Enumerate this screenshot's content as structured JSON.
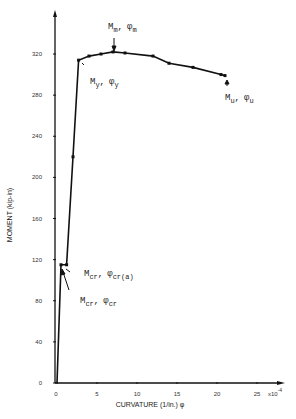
{
  "chart_data": {
    "type": "line",
    "title": "",
    "xlabel": "CURVATURE (1/in.) φ",
    "ylabel": "MOMENT (kip-in)",
    "x_multiplier_label": "x10",
    "x_multiplier_exp": "-4",
    "xlim": [
      0,
      28
    ],
    "ylim": [
      0,
      360
    ],
    "x_ticks": [
      0,
      5,
      10,
      15,
      20,
      25
    ],
    "y_ticks": [
      0,
      40,
      80,
      120,
      160,
      200,
      240,
      280,
      320
    ],
    "x_tick_labels": [
      "0",
      "5",
      "10",
      "15",
      "20",
      "25"
    ],
    "y_tick_labels": [
      "0",
      "40",
      "80",
      "120",
      "160",
      "200",
      "240",
      "280",
      "320"
    ],
    "grid": false,
    "series": [
      {
        "name": "Moment-Curvature",
        "x": [
          0.0,
          0.5,
          1.2,
          2.0,
          2.7,
          4.0,
          5.5,
          7.0,
          8.5,
          12.0,
          14.0,
          17.0,
          20.5,
          21.0
        ],
        "y": [
          0,
          115,
          115,
          220,
          314,
          318,
          320,
          322,
          321,
          318,
          311,
          307,
          300,
          299
        ]
      }
    ],
    "annotations": [
      {
        "label": "M",
        "sub1": "m",
        "phi_sub": "m",
        "text": "Mm, φm",
        "point": [
          7.0,
          322
        ]
      },
      {
        "label": "M",
        "sub1": "y",
        "phi_sub": "y",
        "text": "My, φy",
        "point": [
          2.7,
          314
        ]
      },
      {
        "label": "M",
        "sub1": "u",
        "phi_sub": "u",
        "text": "Mu, φu",
        "point": [
          21.0,
          299
        ]
      },
      {
        "label": "M",
        "sub1": "cr",
        "phi_sub": "cr(a)",
        "text": "Mcr, φcr(a)",
        "point": [
          1.2,
          115
        ]
      },
      {
        "label": "M",
        "sub1": "cr",
        "phi_sub": "cr",
        "text": "Mcr, φcr",
        "point": [
          0.5,
          115
        ]
      }
    ]
  },
  "labels": {
    "xlabel": "CURVATURE (1/in.) φ",
    "ylabel": "MOMENT (kip-in)",
    "x_mult": "x10",
    "x_mult_exp": "-4",
    "ann_m_main": "M",
    "ann_m_sub": "m",
    "ann_m_phi": "φ",
    "ann_m_phisub": "m",
    "ann_y_main": "M",
    "ann_y_sub": "y",
    "ann_y_phi": "φ",
    "ann_y_phisub": "y",
    "ann_u_main": "M",
    "ann_u_sub": "u",
    "ann_u_phi": "φ",
    "ann_u_phisub": "u",
    "ann_cra_main": "M",
    "ann_cra_sub": "cr",
    "ann_cra_phi": "φ",
    "ann_cra_phisub": "cr(a)",
    "ann_cr_main": "M",
    "ann_cr_sub": "cr",
    "ann_cr_phi": "φ",
    "ann_cr_phisub": "cr",
    "comma": ","
  }
}
